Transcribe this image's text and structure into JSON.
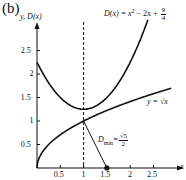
{
  "panel_label": "(b)",
  "chart_data": {
    "type": "line",
    "title": "",
    "xlabel": "x",
    "ylabel": "y, D(x)",
    "xlim": [
      0,
      2.85
    ],
    "ylim": [
      0,
      2.75
    ],
    "x_ticks": [
      0.5,
      1,
      1.5,
      2,
      2.5
    ],
    "x_tick_labels": [
      "0.5",
      "1",
      "1.5",
      "2",
      "2.5"
    ],
    "y_ticks": [
      0.5,
      1,
      1.5,
      2,
      2.5
    ],
    "y_tick_labels": [
      "0.5",
      "1",
      "1.5",
      "2",
      "2.5"
    ],
    "grid": false,
    "series": [
      {
        "name": "D(x) = x^2 - 2x + 9/4",
        "label_parts": {
          "lhs": "D(x) = x",
          "exp": "2",
          "mid": " − 2x + ",
          "num": "9",
          "den": "4"
        },
        "x": [
          0,
          0.25,
          0.5,
          0.75,
          1,
          1.25,
          1.5,
          1.75,
          2,
          2.25,
          2.5
        ],
        "values": [
          2.25,
          1.8125,
          1.5,
          1.3125,
          1.25,
          1.3125,
          1.5,
          1.8125,
          2.25,
          2.8125,
          3.5
        ]
      },
      {
        "name": "y = √x",
        "label_parts": {
          "text": "y = √x"
        },
        "x": [
          0,
          0.25,
          0.5,
          1,
          1.5,
          2,
          2.5,
          2.8
        ],
        "values": [
          0,
          0.5,
          0.707,
          1,
          1.225,
          1.414,
          1.581,
          1.673
        ]
      }
    ],
    "annotations": [
      {
        "type": "vline",
        "x": 1,
        "style": "dashed"
      },
      {
        "type": "segment",
        "from": [
          1,
          1
        ],
        "to": [
          1.5,
          0
        ],
        "label": "D_min = √5 / 2",
        "label_parts": {
          "main": "D",
          "sub": "min",
          "eq": "=",
          "num": "√5",
          "den": "2"
        }
      },
      {
        "type": "point",
        "x": 1.5,
        "y": 0,
        "filled": true
      }
    ]
  }
}
